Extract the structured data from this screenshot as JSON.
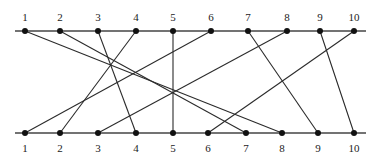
{
  "diagram": {
    "type": "bipartite-permutation-matching",
    "rail_color": "#444444",
    "edge_color": "#2b2b2b",
    "node_color": "#111111",
    "top_rail": {
      "y": 31,
      "x_start": 15,
      "x_end": 366
    },
    "bottom_rail": {
      "y": 133,
      "x_start": 15,
      "x_end": 366
    },
    "top_nodes": [
      {
        "label": "1",
        "x": 25
      },
      {
        "label": "2",
        "x": 60
      },
      {
        "label": "3",
        "x": 98
      },
      {
        "label": "4",
        "x": 136
      },
      {
        "label": "5",
        "x": 173
      },
      {
        "label": "6",
        "x": 211
      },
      {
        "label": "7",
        "x": 248
      },
      {
        "label": "8",
        "x": 287
      },
      {
        "label": "9",
        "x": 320
      },
      {
        "label": "10",
        "x": 354
      }
    ],
    "bottom_nodes": [
      {
        "label": "1",
        "x": 25
      },
      {
        "label": "2",
        "x": 60
      },
      {
        "label": "3",
        "x": 98
      },
      {
        "label": "4",
        "x": 136
      },
      {
        "label": "5",
        "x": 173
      },
      {
        "label": "6",
        "x": 208
      },
      {
        "label": "7",
        "x": 246
      },
      {
        "label": "8",
        "x": 282
      },
      {
        "label": "9",
        "x": 318
      },
      {
        "label": "10",
        "x": 354
      }
    ],
    "edges": [
      {
        "top": "1",
        "bottom": "8"
      },
      {
        "top": "2",
        "bottom": "7"
      },
      {
        "top": "3",
        "bottom": "4"
      },
      {
        "top": "4",
        "bottom": "2"
      },
      {
        "top": "5",
        "bottom": "5"
      },
      {
        "top": "6",
        "bottom": "1"
      },
      {
        "top": "7",
        "bottom": "9"
      },
      {
        "top": "8",
        "bottom": "3"
      },
      {
        "top": "9",
        "bottom": "10"
      },
      {
        "top": "10",
        "bottom": "6"
      }
    ]
  }
}
